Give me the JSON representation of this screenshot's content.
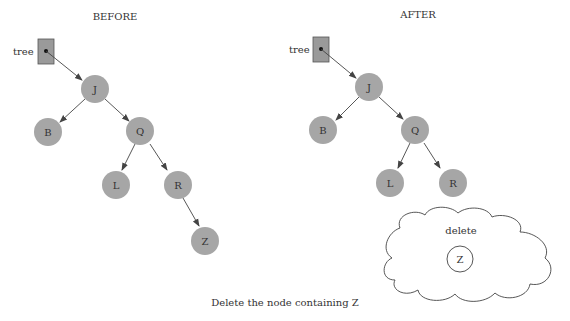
{
  "before": {
    "title": "BEFORE",
    "pointer_label": "tree",
    "nodes": {
      "J": "J",
      "B": "B",
      "Q": "Q",
      "L": "L",
      "R": "R",
      "Z": "Z"
    }
  },
  "after": {
    "title": "AFTER",
    "pointer_label": "tree",
    "nodes": {
      "J": "J",
      "B": "B",
      "Q": "Q",
      "L": "L",
      "R": "R"
    },
    "cloud_label": "delete",
    "deleted_node": "Z"
  },
  "caption": "Delete the node containing Z",
  "colors": {
    "node_fill": "#a6a6a6",
    "pointer_box": "#9a9a9a",
    "line": "#444444"
  }
}
